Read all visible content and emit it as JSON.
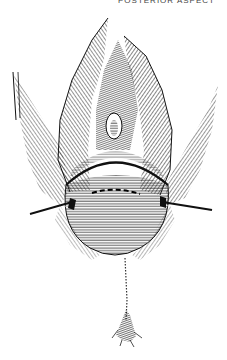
{
  "figure": {
    "caption_fragment": "POSTERIOR ASPECT",
    "colors": {
      "ink": "#111111",
      "paper": "#ffffff",
      "mid": "#555555"
    }
  }
}
